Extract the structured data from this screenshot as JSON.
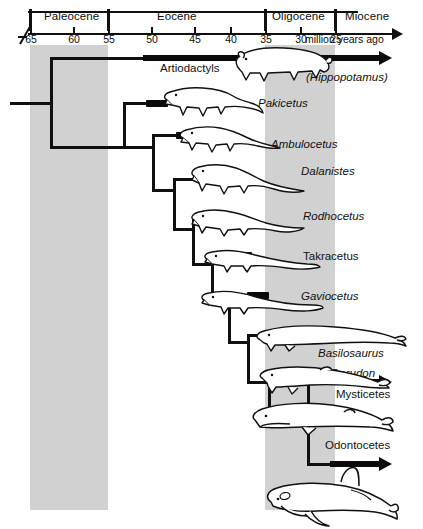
{
  "figure": {
    "type": "cladogram"
  },
  "timeline": {
    "units_label": "million years ago",
    "epochs": [
      {
        "name": "Paleocene",
        "start_ma": 65,
        "end_ma": 56,
        "shaded": true
      },
      {
        "name": "Eocene",
        "start_ma": 56,
        "end_ma": 34,
        "shaded": false
      },
      {
        "name": "Oligocene",
        "start_ma": 34,
        "end_ma": 24,
        "shaded": true
      },
      {
        "name": "Miocene",
        "start_ma": 24,
        "end_ma": 21,
        "shaded": false
      }
    ],
    "ticks": [
      {
        "label": "65",
        "value": 65
      },
      {
        "label": "60",
        "value": 60
      },
      {
        "label": "55",
        "value": 55
      },
      {
        "label": "50",
        "value": 50
      },
      {
        "label": "45",
        "value": 45
      },
      {
        "label": "40",
        "value": 40
      },
      {
        "label": "35",
        "value": 35
      },
      {
        "label": "30",
        "value": 30
      },
      {
        "label": "25",
        "value": 25
      }
    ]
  },
  "taxa": [
    {
      "label": "Artiodactyls",
      "italic": false,
      "style": "arrow"
    },
    {
      "label": "(Hippopotamus)",
      "italic": true,
      "style": "plain"
    },
    {
      "label": "Pakicetus",
      "italic": true,
      "style": "node"
    },
    {
      "label": "Ambulocetus",
      "italic": true,
      "style": "node"
    },
    {
      "label": "Dalanistes",
      "italic": true,
      "style": "node"
    },
    {
      "label": "Rodhocetus",
      "italic": true,
      "style": "node"
    },
    {
      "label": "Takracetus",
      "italic": false,
      "style": "node"
    },
    {
      "label": "Gaviocetus",
      "italic": true,
      "style": "node"
    },
    {
      "label": "Basilosaurus",
      "italic": true,
      "style": "node"
    },
    {
      "label": "Dorudon",
      "italic": true,
      "style": "node"
    },
    {
      "label": "Mysticetes",
      "italic": false,
      "style": "arrow"
    },
    {
      "label": "Odontocetes",
      "italic": false,
      "style": "arrow"
    }
  ],
  "colors": {
    "band": "#c9c9c9",
    "ink": "#101010",
    "background": "#ffffff"
  }
}
